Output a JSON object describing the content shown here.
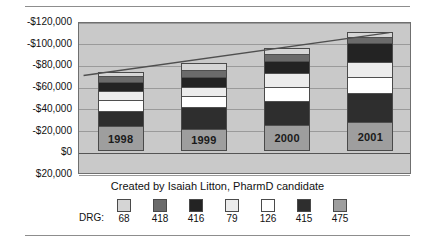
{
  "caption": "Created by Isaiah Litton, PharmD candidate",
  "legend_title": "DRG:",
  "colors": {
    "plot_background": "#c9c9c9",
    "gridline": "#9a9a9a",
    "border": "#4a4a4a",
    "trendline": "#4f4f4f",
    "drg_68": "#d5d5d5",
    "drg_418": "#6b6b6b",
    "drg_416": "#232323",
    "drg_79": "#ececec",
    "drg_126": "#ffffff",
    "drg_415": "#2e2e2e",
    "drg_475": "#9e9e9e"
  },
  "chart_data": {
    "type": "bar",
    "title": "",
    "subtitle": "",
    "xlabel": "",
    "ylabel": "",
    "stacked": true,
    "grid": true,
    "legend_position": "bottom",
    "categories": [
      "1998",
      "1999",
      "2000",
      "2001"
    ],
    "ytick_labels": [
      "-$120,000",
      "-$100,000",
      "-$80,000",
      "-$60,000",
      "-$40,000",
      "-$20,000",
      "$0",
      "$20,000"
    ],
    "ytick_values": [
      -120000,
      -100000,
      -80000,
      -60000,
      -40000,
      -20000,
      0,
      20000
    ],
    "ylim": [
      20000,
      -120000
    ],
    "axis_inverted": true,
    "series": [
      {
        "name": "475",
        "values": [
          -22000,
          -19500,
          -23000,
          -25500
        ]
      },
      {
        "name": "415",
        "values": [
          -14500,
          -20500,
          -22500,
          -27000
        ]
      },
      {
        "name": "126",
        "values": [
          -10500,
          -10500,
          -13000,
          -15000
        ]
      },
      {
        "name": "79",
        "values": [
          -8000,
          -8500,
          -13000,
          -14500
        ]
      },
      {
        "name": "416",
        "values": [
          -8500,
          -9000,
          -11500,
          -18000
        ]
      },
      {
        "name": "418",
        "values": [
          -6000,
          -6500,
          -6500,
          -5500
        ]
      },
      {
        "name": "68",
        "values": [
          -3500,
          -6500,
          -5500,
          -4500
        ]
      }
    ],
    "totals": [
      -73000,
      -81000,
      -95000,
      -110000
    ],
    "trendline": {
      "present": true,
      "start": {
        "x": "1998",
        "y": -71000
      },
      "end": {
        "x": "2001",
        "y": -111000
      }
    }
  },
  "legend": [
    {
      "label": "68",
      "color_key": "drg_68"
    },
    {
      "label": "418",
      "color_key": "drg_418"
    },
    {
      "label": "416",
      "color_key": "drg_416"
    },
    {
      "label": "79",
      "color_key": "drg_79"
    },
    {
      "label": "126",
      "color_key": "drg_126"
    },
    {
      "label": "415",
      "color_key": "drg_415"
    },
    {
      "label": "475",
      "color_key": "drg_475"
    }
  ]
}
